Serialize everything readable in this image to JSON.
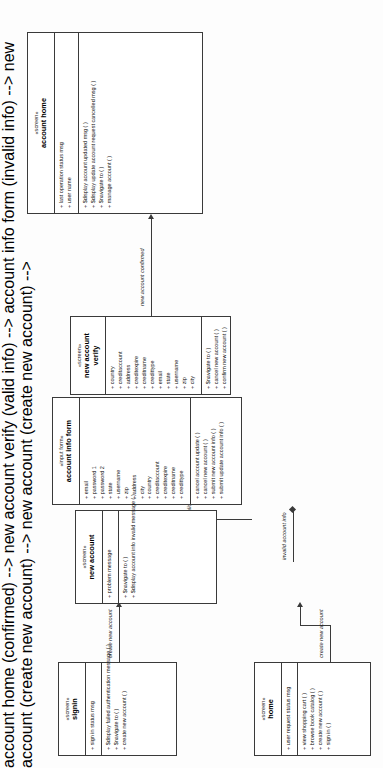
{
  "diagram": {
    "stereotype_open": "«",
    "stereotype_close": "»"
  },
  "classes": [
    {
      "id": "account-home",
      "stereotype": "«screen»",
      "name": "account home",
      "attributes": [
        "+ last operation status msg",
        "+ user name"
      ],
      "operations": [
        "+ $display account updated msg ( )",
        "+ $display update account request cancelled msg ( )",
        "+ $navigate to ( )",
        "+ manage account ( )"
      ]
    },
    {
      "id": "new-account-verify",
      "stereotype": "«screen»",
      "name": "new account verify",
      "attributes": [
        "+ country",
        "+ creditaccount",
        "+ address",
        "+ creditexpire",
        "+ creditname",
        "+ credittype",
        "+ email",
        "+ state",
        "+ username",
        "+ zip",
        "+ city"
      ],
      "operations": [
        "+ $navigate to ( )",
        "+ cancel new account ( )",
        "+ confirm new account ( )"
      ]
    },
    {
      "id": "account-info-form",
      "stereotype": "«input form»",
      "name": "account info form",
      "attributes": [
        "+ email",
        "+ password 1",
        "+ password 2",
        "+ state",
        "+ username",
        "+ zip",
        "+ address",
        "+ city",
        "+ country",
        "+ creditaccount",
        "+ creditexpire",
        "+ creditname",
        "+ credittype"
      ],
      "operations": [
        "+ cancel account update ( )",
        "+ cancel new account ( )",
        "+ submit new account info ( )",
        "+ submit update account info ( )"
      ]
    },
    {
      "id": "new-account",
      "stereotype": "«screen»",
      "name": "new account",
      "attributes": [
        "+ problem message"
      ],
      "operations": [
        "+ $navigate to ( )",
        "+ $display account info invalid message ( )"
      ]
    },
    {
      "id": "signin",
      "stereotype": "«screen»",
      "name": "signin",
      "attributes": [
        "+ sign in status msg"
      ],
      "operations": [
        "+ $display failed authentication message ( )",
        "+ $navigate to ( )",
        "+ create new account ( )"
      ]
    },
    {
      "id": "home",
      "stereotype": "«screen»",
      "name": "home",
      "attributes": [
        "+ user request status msg"
      ],
      "operations": [
        "+ view shopping cart ( )",
        "+ browse book catalog ( )",
        "+ create new account ( )",
        "+ sign in ( )"
      ]
    }
  ],
  "edges": [
    {
      "id": "new-account-confirmed",
      "label": "new account confirmed"
    },
    {
      "id": "valid-account-info-entered",
      "label": "valid account info entered"
    },
    {
      "id": "invalid-account-info",
      "label": "invalid account info"
    },
    {
      "id": "create-new-account-signin",
      "label": "create new account"
    },
    {
      "id": "create-new-account-home",
      "label": "create new account"
    }
  ]
}
